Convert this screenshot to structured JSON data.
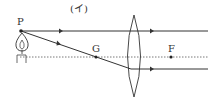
{
  "diagram": {
    "title": "(イ)",
    "labels": {
      "object_point": "P",
      "center_point": "G",
      "focal_point": "F"
    },
    "elements": [
      "candle (object)",
      "optical axis (dotted)",
      "convex lens",
      "ray parallel to axis",
      "ray through G"
    ],
    "colors": {
      "line": "#333333",
      "background": "#ffffff"
    }
  }
}
